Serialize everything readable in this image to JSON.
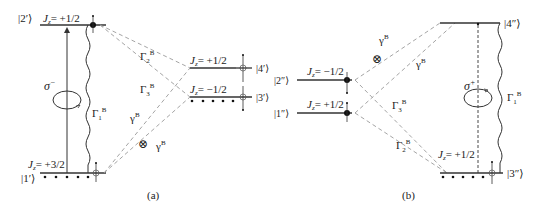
{
  "panels": {
    "a": {
      "caption": "(a)",
      "states": {
        "s2p": {
          "ket": "|2′⟩",
          "jz": "= +1/2"
        },
        "s1p": {
          "ket": "|1′⟩",
          "jz": "= +3/2"
        },
        "s4p": {
          "ket": "|4′⟩",
          "jz": "= +1/2"
        },
        "s3p": {
          "ket": "|3′⟩",
          "jz": "= −1/2"
        }
      },
      "transitions": {
        "pump": "σ",
        "pump_sup": "−",
        "gamma1": "Γ",
        "gamma1_sub": "1",
        "gamma2": "Γ",
        "gamma2_sub": "2",
        "gamma3": "Γ",
        "gamma3_sub": "3",
        "gammaB_1": "γ",
        "gammaB_2": "γ",
        "sup_B": "B",
        "cross_symbol": "⊗"
      }
    },
    "b": {
      "caption": "(b)",
      "states": {
        "s2pp": {
          "ket": "|2″⟩",
          "jz": "= −1/2"
        },
        "s1pp": {
          "ket": "|1″⟩",
          "jz": "= +1/2"
        },
        "s4pp": {
          "ket": "|4″⟩"
        },
        "s3pp": {
          "ket": "|3″⟩",
          "jz": "= +1/2"
        }
      },
      "transitions": {
        "pump": "σ",
        "pump_sup": "+",
        "gamma1": "Γ",
        "gamma1_sub": "1",
        "gamma2": "Γ",
        "gamma2_sub": "2",
        "gamma3": "Γ",
        "gamma3_sub": "3",
        "gammaB_1": "γ",
        "gammaB_2": "γ",
        "sup_B": "B",
        "cross_symbol": "⊗"
      }
    }
  },
  "jz_symbol": "J",
  "jz_sub": "z",
  "colors": {
    "line": "#333333",
    "dashed": "#9a9a9a"
  }
}
